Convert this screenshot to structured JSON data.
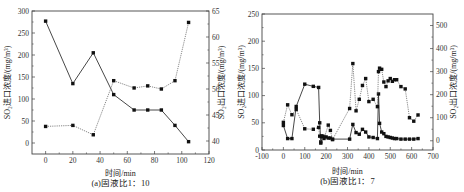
{
  "chart_data": [
    {
      "type": "line",
      "panel": "a",
      "caption": "(a)固液比1：10",
      "xlabel": "时间/min",
      "ylabel_left": "SO₂进口浓度/(mg/m³)",
      "ylabel_right": "SO₂出口浓度/(mg/m³)",
      "xlim": [
        -10,
        120
      ],
      "ylim_left": [
        -25,
        300
      ],
      "ylim_right": [
        37.5,
        65
      ],
      "xticks": [
        0,
        20,
        40,
        60,
        80,
        100,
        120
      ],
      "yticks_left": [
        0,
        50,
        100,
        150,
        200,
        250,
        300
      ],
      "yticks_right": [
        40,
        45,
        50,
        55,
        60,
        65
      ],
      "grid": false,
      "series": [
        {
          "name": "SO₂进口浓度",
          "axis": "left",
          "style": "solid",
          "x": [
            0,
            20,
            35,
            50,
            65,
            75,
            85,
            95,
            105
          ],
          "values": [
            277,
            135,
            205,
            110,
            75,
            75,
            75,
            40,
            3
          ]
        },
        {
          "name": "SO₂出口浓度",
          "axis": "right",
          "style": "dotted",
          "x": [
            0,
            20,
            35,
            50,
            65,
            75,
            85,
            95,
            105
          ],
          "values": [
            42.8,
            43.0,
            41.2,
            51.6,
            50.2,
            50.6,
            50.0,
            51.6,
            62.8
          ]
        }
      ]
    },
    {
      "type": "line",
      "panel": "b",
      "caption": "(b)固液比1：7",
      "xlabel": "时间/min",
      "ylabel_left": "SO₂进口浓度/(mg/m³)",
      "ylabel_right": "SO₂出口浓度/(mg/m³)",
      "xlim": [
        -100,
        700
      ],
      "ylim_left": [
        0,
        250
      ],
      "ylim_right": [
        -40,
        550
      ],
      "xticks": [
        -100,
        0,
        100,
        200,
        300,
        400,
        500,
        600,
        700
      ],
      "yticks_left": [
        0,
        50,
        100,
        150,
        200,
        250
      ],
      "yticks_right": [
        0,
        100,
        200,
        300,
        400,
        500
      ],
      "grid": false,
      "series": [
        {
          "name": "SO₂进口浓度",
          "axis": "left",
          "style": "solid",
          "x": [
            0,
            20,
            40,
            60,
            100,
            140,
            165,
            170,
            175,
            180,
            190,
            200,
            210,
            220,
            230,
            310,
            325,
            340,
            355,
            370,
            385,
            400,
            420,
            440,
            445,
            450,
            460,
            470,
            480,
            490,
            500,
            510,
            520,
            530,
            550,
            570,
            590,
            610,
            630
          ],
          "values": [
            45,
            21,
            21,
            80,
            121,
            117,
            115,
            50,
            15,
            26,
            25,
            24,
            22,
            22,
            20,
            20,
            47,
            32,
            29,
            38,
            33,
            24,
            23,
            21,
            103,
            49,
            33,
            30,
            25,
            24,
            23,
            22,
            21,
            21,
            20,
            20,
            20,
            20,
            21
          ]
        },
        {
          "name": "SO₂出口浓度",
          "axis": "right",
          "style": "dotted",
          "x": [
            0,
            20,
            40,
            60,
            100,
            140,
            165,
            170,
            175,
            180,
            190,
            210,
            220,
            230,
            310,
            325,
            340,
            355,
            370,
            385,
            400,
            420,
            440,
            445,
            450,
            460,
            470,
            480,
            490,
            500,
            510,
            520,
            530,
            550,
            570,
            590,
            610,
            630
          ],
          "values": [
            80,
            156,
            113,
            136,
            52,
            50,
            58,
            20,
            -10,
            18,
            10,
            68,
            45,
            5,
            140,
            335,
            130,
            180,
            240,
            270,
            170,
            180,
            148,
            300,
            315,
            310,
            255,
            235,
            260,
            270,
            258,
            265,
            265,
            235,
            225,
            100,
            85,
            112
          ]
        }
      ]
    }
  ]
}
